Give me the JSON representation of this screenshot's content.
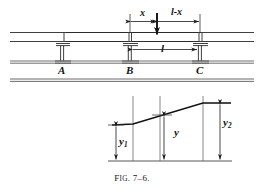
{
  "figure": {
    "caption_prefix": "F",
    "caption_smallcaps": "IG",
    "caption_number": ". 7–6.",
    "caption_full": "Fig. 7–6.",
    "ink_color": "#1a1a1a",
    "background_color": "#ffffff"
  },
  "top_diagram": {
    "name": "beam-on-columns-elevation",
    "supports": [
      {
        "id": "A",
        "label": "A",
        "x": 62
      },
      {
        "id": "B",
        "label": "B",
        "x": 130
      },
      {
        "id": "C",
        "label": "C",
        "x": 200
      }
    ],
    "dimensions": [
      {
        "id": "x",
        "label": "x",
        "from": "B",
        "to": "load",
        "position": "above-beam"
      },
      {
        "id": "l-minus-x",
        "label": "l-x",
        "from": "load",
        "to": "C",
        "position": "above-beam"
      },
      {
        "id": "span-l",
        "label": "l",
        "from": "B",
        "to": "C",
        "position": "below-beam"
      }
    ],
    "load": {
      "id": "point-load",
      "label": "",
      "x": 157,
      "direction": "down"
    }
  },
  "bottom_diagram": {
    "name": "influence-line-diagram",
    "ordinates": [
      {
        "id": "y1",
        "base": "y",
        "sub": "1",
        "label": "y1"
      },
      {
        "id": "y",
        "base": "y",
        "sub": "",
        "label": "y"
      },
      {
        "id": "y2",
        "base": "y",
        "sub": "2",
        "label": "y2"
      }
    ],
    "baseline": {
      "id": "datum-line"
    }
  }
}
